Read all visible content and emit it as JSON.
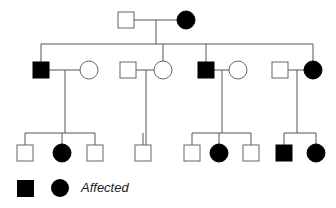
{
  "title": "",
  "colors": {
    "line": "#555555",
    "affected": "#000000",
    "unaffected": "#ffffff"
  },
  "pedigree": {
    "generations": [
      {
        "id": "I",
        "individuals": [
          {
            "id": "I-1",
            "sex": "male",
            "affected": false,
            "cx": 126,
            "cy": 20
          },
          {
            "id": "I-2",
            "sex": "female",
            "affected": true,
            "cx": 186,
            "cy": 20
          }
        ]
      },
      {
        "id": "II",
        "individuals": [
          {
            "id": "II-1",
            "sex": "male",
            "affected": true,
            "cx": 41,
            "cy": 70
          },
          {
            "id": "II-1s",
            "sex": "female",
            "affected": false,
            "cx": 89,
            "cy": 70,
            "spouse": true
          },
          {
            "id": "II-2s",
            "sex": "male",
            "affected": false,
            "cx": 128,
            "cy": 70,
            "spouse": true
          },
          {
            "id": "II-2",
            "sex": "female",
            "affected": false,
            "cx": 163,
            "cy": 70
          },
          {
            "id": "II-3",
            "sex": "male",
            "affected": true,
            "cx": 206,
            "cy": 70
          },
          {
            "id": "II-3s",
            "sex": "female",
            "affected": false,
            "cx": 238,
            "cy": 70,
            "spouse": true
          },
          {
            "id": "II-4s",
            "sex": "male",
            "affected": false,
            "cx": 280,
            "cy": 70,
            "spouse": true
          },
          {
            "id": "II-4",
            "sex": "female",
            "affected": true,
            "cx": 313,
            "cy": 70
          }
        ]
      },
      {
        "id": "III",
        "individuals": [
          {
            "id": "III-1",
            "sex": "male",
            "affected": false,
            "cx": 25,
            "cy": 153
          },
          {
            "id": "III-2",
            "sex": "female",
            "affected": true,
            "cx": 62,
            "cy": 153
          },
          {
            "id": "III-3",
            "sex": "male",
            "affected": false,
            "cx": 95,
            "cy": 153
          },
          {
            "id": "III-4",
            "sex": "male",
            "affected": false,
            "cx": 143,
            "cy": 153
          },
          {
            "id": "III-5",
            "sex": "male",
            "affected": false,
            "cx": 192,
            "cy": 153
          },
          {
            "id": "III-6",
            "sex": "female",
            "affected": true,
            "cx": 219,
            "cy": 153
          },
          {
            "id": "III-7",
            "sex": "male",
            "affected": false,
            "cx": 251,
            "cy": 153
          },
          {
            "id": "III-8",
            "sex": "male",
            "affected": true,
            "cx": 284,
            "cy": 153
          },
          {
            "id": "III-9",
            "sex": "female",
            "affected": true,
            "cx": 316,
            "cy": 153
          }
        ]
      }
    ],
    "couples": [
      {
        "partners": [
          "I-1",
          "I-2"
        ],
        "children": [
          "II-1",
          "II-2",
          "II-3",
          "II-4"
        ]
      },
      {
        "partners": [
          "II-1",
          "II-1s"
        ],
        "children": [
          "III-1",
          "III-2",
          "III-3"
        ]
      },
      {
        "partners": [
          "II-2s",
          "II-2"
        ],
        "children": [
          "III-4"
        ]
      },
      {
        "partners": [
          "II-3",
          "II-3s"
        ],
        "children": [
          "III-5",
          "III-6",
          "III-7"
        ]
      },
      {
        "partners": [
          "II-4s",
          "II-4"
        ],
        "children": [
          "III-8",
          "III-9"
        ]
      }
    ]
  },
  "legend": {
    "symbols": [
      "filled-square",
      "filled-circle"
    ],
    "label": "Affected"
  }
}
